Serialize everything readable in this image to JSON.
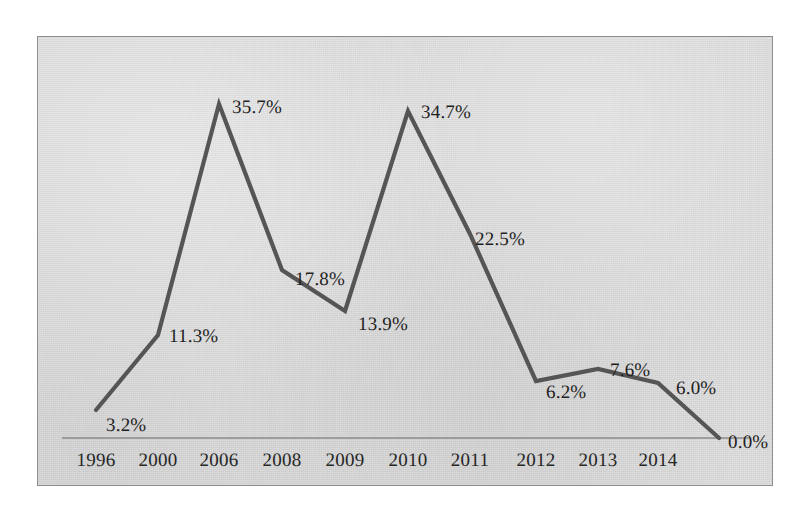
{
  "chart_data": {
    "type": "line",
    "title": "",
    "subtitle": "",
    "xlabel": "",
    "ylabel": "",
    "grid": false,
    "legend": "none",
    "axis_line": "baseline-only",
    "categories": [
      "1996",
      "2000",
      "2006",
      "2008",
      "2009",
      "2010",
      "2011",
      "2012",
      "2013",
      "2014",
      ""
    ],
    "values": [
      3.2,
      11.3,
      35.7,
      17.8,
      13.9,
      34.7,
      22.5,
      6.2,
      7.6,
      6.0,
      0.0
    ],
    "value_labels": [
      "3.2%",
      "11.3%",
      "35.7%",
      "17.8%",
      "13.9%",
      "34.7%",
      "22.5%",
      "6.2%",
      "7.6%",
      "6.0%",
      "0.0%"
    ],
    "ylim": [
      0,
      38
    ],
    "series": [
      {
        "name": "",
        "values": [
          3.2,
          11.3,
          35.7,
          17.8,
          13.9,
          34.7,
          22.5,
          6.2,
          7.6,
          6.0,
          0.0
        ]
      }
    ],
    "points": [
      {
        "category": "1996",
        "value": 3.2,
        "label": "3.2%",
        "px": 58,
        "py": 373,
        "lx": 68,
        "ly": 378
      },
      {
        "category": "2000",
        "value": 11.3,
        "label": "11.3%",
        "px": 120,
        "py": 298,
        "lx": 131,
        "ly": 289
      },
      {
        "category": "2006",
        "value": 35.7,
        "label": "35.7%",
        "px": 181,
        "py": 67,
        "lx": 194,
        "ly": 60
      },
      {
        "category": "2008",
        "value": 17.8,
        "label": "17.8%",
        "px": 244,
        "py": 233,
        "lx": 257,
        "ly": 232
      },
      {
        "category": "2009",
        "value": 13.9,
        "label": "13.9%",
        "px": 307,
        "py": 274,
        "lx": 320,
        "ly": 277
      },
      {
        "category": "2010",
        "value": 34.7,
        "label": "34.7%",
        "px": 370,
        "py": 74,
        "lx": 383,
        "ly": 65
      },
      {
        "category": "2011",
        "value": 22.5,
        "label": "22.5%",
        "px": 432,
        "py": 197,
        "lx": 437,
        "ly": 192
      },
      {
        "category": "2012",
        "value": 6.2,
        "label": "6.2%",
        "px": 498,
        "py": 344,
        "lx": 508,
        "ly": 345
      },
      {
        "category": "2013",
        "value": 7.6,
        "label": "7.6%",
        "px": 560,
        "py": 332,
        "lx": 572,
        "ly": 323
      },
      {
        "category": "2014",
        "value": 6.0,
        "label": "6.0%",
        "px": 620,
        "py": 346,
        "lx": 638,
        "ly": 341
      },
      {
        "category": "",
        "value": 0.0,
        "label": "0.0%",
        "px": 681,
        "py": 401,
        "lx": 690,
        "ly": 395
      }
    ],
    "tick_labels": [
      {
        "text": "1996",
        "x": 58
      },
      {
        "text": "2000",
        "x": 120
      },
      {
        "text": "2006",
        "x": 181
      },
      {
        "text": "2008",
        "x": 244
      },
      {
        "text": "2009",
        "x": 307
      },
      {
        "text": "2010",
        "x": 370
      },
      {
        "text": "2011",
        "x": 432
      },
      {
        "text": "2012",
        "x": 498
      },
      {
        "text": "2013",
        "x": 560
      },
      {
        "text": "2014",
        "x": 620
      }
    ],
    "colors": {
      "line": "#555555",
      "plot_background": "#d9d9d9",
      "frame_border": "#8e8e8e",
      "axis_line": "#8a8a8a",
      "label_text": "#1f1f1f",
      "page_background": "#ffffff"
    }
  }
}
